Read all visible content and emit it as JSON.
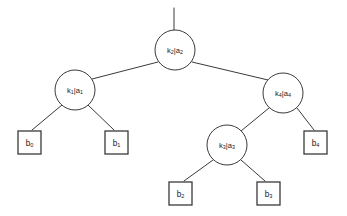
{
  "diagram": {
    "type": "binary-tree",
    "title": "",
    "background_color": "#ffffff",
    "stroke_color": "#3a3a3a",
    "text_color": "#1a1a1a",
    "separator": "|",
    "internal_nodes": [
      {
        "id": "k2",
        "key": "k",
        "key_sub": "2",
        "value": "a",
        "value_sub": "2",
        "label": "k2 | a2",
        "role": "root",
        "cx": 175,
        "cy": 50,
        "r": 20
      },
      {
        "id": "k1",
        "key": "k",
        "key_sub": "1",
        "value": "a",
        "value_sub": "1",
        "label": "k1 | a1",
        "role": "internal",
        "cx": 75,
        "cy": 90,
        "r": 20
      },
      {
        "id": "k4",
        "key": "k",
        "key_sub": "4",
        "value": "a",
        "value_sub": "4",
        "label": "k4 | a4",
        "role": "internal",
        "cx": 283,
        "cy": 93,
        "r": 20
      },
      {
        "id": "k3",
        "key": "k",
        "key_sub": "3",
        "value": "a",
        "value_sub": "3",
        "label": "k3 | a3",
        "role": "internal",
        "cx": 227,
        "cy": 145,
        "r": 20
      }
    ],
    "leaf_nodes": [
      {
        "id": "b0",
        "key": "b",
        "key_sub": "0",
        "label": "b0",
        "x": 18,
        "y": 131,
        "w": 23,
        "h": 23
      },
      {
        "id": "b1",
        "key": "b",
        "key_sub": "1",
        "label": "b1",
        "x": 105,
        "y": 131,
        "w": 23,
        "h": 23
      },
      {
        "id": "b2",
        "key": "b",
        "key_sub": "2",
        "label": "b2",
        "x": 169,
        "y": 182,
        "w": 23,
        "h": 23
      },
      {
        "id": "b3",
        "key": "b",
        "key_sub": "3",
        "label": "b3",
        "x": 257,
        "y": 182,
        "w": 23,
        "h": 23
      },
      {
        "id": "b4",
        "key": "b",
        "key_sub": "4",
        "label": "b4",
        "x": 304,
        "y": 131,
        "w": 23,
        "h": 23
      }
    ],
    "edges": [
      {
        "id": "stub-root",
        "from": "parent-stub",
        "to": "k2",
        "x1": 174,
        "y1": 8,
        "x2": 174,
        "y2": 30
      },
      {
        "id": "k2-k1",
        "from": "k2",
        "to": "k1",
        "x1": 158,
        "y1": 62,
        "x2": 92,
        "y2": 79
      },
      {
        "id": "k2-k4",
        "from": "k2",
        "to": "k4",
        "x1": 192,
        "y1": 62,
        "x2": 268,
        "y2": 80
      },
      {
        "id": "k1-b0",
        "from": "k1",
        "to": "b0",
        "x1": 62,
        "y1": 105,
        "x2": 32,
        "y2": 130
      },
      {
        "id": "k1-b1",
        "from": "k1",
        "to": "b1",
        "x1": 88,
        "y1": 105,
        "x2": 114,
        "y2": 130
      },
      {
        "id": "k4-k3",
        "from": "k4",
        "to": "k3",
        "x1": 269,
        "y1": 108,
        "x2": 241,
        "y2": 131
      },
      {
        "id": "k4-b4",
        "from": "k4",
        "to": "b4",
        "x1": 297,
        "y1": 108,
        "x2": 314,
        "y2": 130
      },
      {
        "id": "k3-b2",
        "from": "k3",
        "to": "b2",
        "x1": 213,
        "y1": 160,
        "x2": 184,
        "y2": 181
      },
      {
        "id": "k3-b3",
        "from": "k3",
        "to": "b3",
        "x1": 241,
        "y1": 160,
        "x2": 265,
        "y2": 181
      }
    ]
  }
}
